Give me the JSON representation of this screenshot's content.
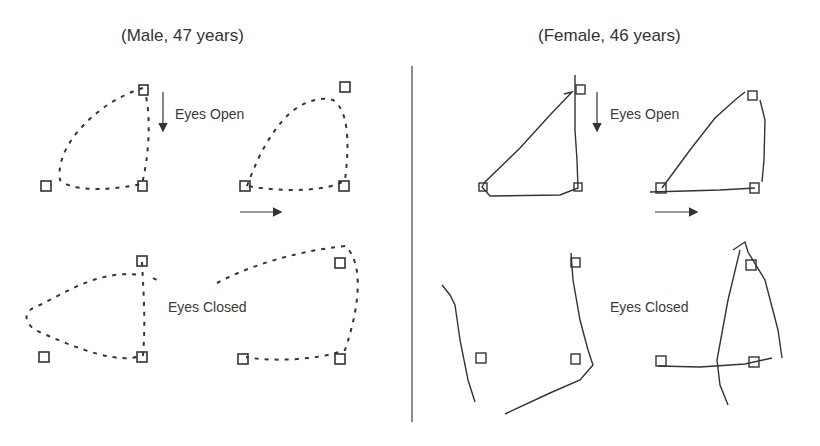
{
  "figure": {
    "left_panel": {
      "title": "(Male, 47 years)",
      "eyes_open_label": "Eyes Open",
      "eyes_closed_label": "Eyes Closed",
      "trace_style": "dashed"
    },
    "right_panel": {
      "title": "(Female, 46 years)",
      "eyes_open_label": "Eyes Open",
      "eyes_closed_label": "Eyes Closed",
      "trace_style": "jagged-solid"
    },
    "arrows": {
      "down": "down-arrow",
      "right": "right-arrow"
    },
    "colors": {
      "ink": "#333333",
      "divider": "#666666",
      "background": "#ffffff"
    }
  }
}
